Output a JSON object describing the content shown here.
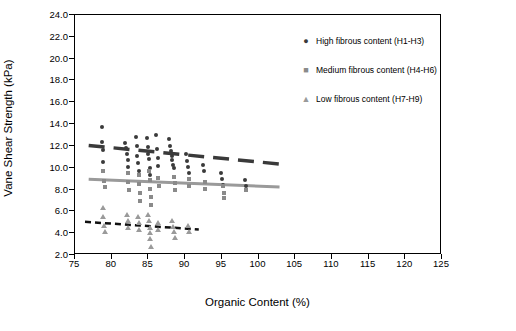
{
  "chart_data": {
    "type": "scatter",
    "title": "",
    "xlabel": "Organic Content (%)",
    "ylabel": "Vane Shear Strength (kPa)",
    "xlim": [
      75,
      125
    ],
    "ylim": [
      2.0,
      24.0
    ],
    "xticks": [
      75,
      80,
      85,
      90,
      95,
      100,
      105,
      110,
      115,
      120,
      125
    ],
    "yticks": [
      "2.0",
      "4.0",
      "6.0",
      "8.0",
      "10.0",
      "12.0",
      "14.0",
      "16.0",
      "18.0",
      "20.0",
      "22.0",
      "24.0"
    ],
    "grid": false,
    "legend_position": "top-right",
    "series": [
      {
        "name": "High fibrous content (H1-H3)",
        "marker": "circle",
        "color": "#3a3a3a",
        "points": [
          [
            78.8,
            13.6
          ],
          [
            78.8,
            12.3
          ],
          [
            78.9,
            11.5
          ],
          [
            79.0,
            10.4
          ],
          [
            82.0,
            12.2
          ],
          [
            82.1,
            11.7
          ],
          [
            82.2,
            11.2
          ],
          [
            82.3,
            10.6
          ],
          [
            82.4,
            10.0
          ],
          [
            83.5,
            12.7
          ],
          [
            83.6,
            11.9
          ],
          [
            83.6,
            11.0
          ],
          [
            83.7,
            10.3
          ],
          [
            83.8,
            9.6
          ],
          [
            85.0,
            12.6
          ],
          [
            85.1,
            11.8
          ],
          [
            85.1,
            11.2
          ],
          [
            85.2,
            10.7
          ],
          [
            85.3,
            9.9
          ],
          [
            85.3,
            9.2
          ],
          [
            86.2,
            12.9
          ],
          [
            86.3,
            11.6
          ],
          [
            86.4,
            10.8
          ],
          [
            86.5,
            10.1
          ],
          [
            88.0,
            12.5
          ],
          [
            88.1,
            11.9
          ],
          [
            88.2,
            11.4
          ],
          [
            88.3,
            11.0
          ],
          [
            88.4,
            10.6
          ],
          [
            88.5,
            10.2
          ],
          [
            88.6,
            9.9
          ],
          [
            90.3,
            11.2
          ],
          [
            90.4,
            10.5
          ],
          [
            90.5,
            10.0
          ],
          [
            90.6,
            9.4
          ],
          [
            92.6,
            10.2
          ],
          [
            92.7,
            9.6
          ],
          [
            95.0,
            9.4
          ],
          [
            95.2,
            8.9
          ],
          [
            95.3,
            8.3
          ],
          [
            98.3,
            8.8
          ],
          [
            98.5,
            8.2
          ]
        ]
      },
      {
        "name": "Medium fibrous content (H4-H6)",
        "marker": "square",
        "color": "#8a8a8a",
        "points": [
          [
            79.0,
            9.6
          ],
          [
            79.1,
            8.7
          ],
          [
            79.2,
            8.1
          ],
          [
            82.3,
            9.4
          ],
          [
            82.4,
            8.6
          ],
          [
            82.5,
            7.9
          ],
          [
            83.8,
            9.2
          ],
          [
            83.9,
            8.4
          ],
          [
            84.0,
            7.6
          ],
          [
            84.0,
            6.9
          ],
          [
            85.2,
            9.6
          ],
          [
            85.3,
            8.8
          ],
          [
            85.4,
            8.0
          ],
          [
            85.5,
            7.2
          ],
          [
            85.5,
            6.5
          ],
          [
            86.5,
            9.0
          ],
          [
            86.6,
            8.2
          ],
          [
            88.6,
            9.1
          ],
          [
            88.7,
            8.5
          ],
          [
            88.8,
            7.9
          ],
          [
            90.6,
            8.9
          ],
          [
            90.7,
            8.2
          ],
          [
            92.8,
            8.6
          ],
          [
            92.9,
            8.0
          ],
          [
            95.3,
            8.2
          ],
          [
            95.4,
            7.6
          ],
          [
            95.5,
            7.1
          ],
          [
            98.5,
            7.9
          ]
        ]
      },
      {
        "name": "Low fibrous content (H7-H9)",
        "marker": "triangle",
        "color": "#9a9a9a",
        "points": [
          [
            78.9,
            6.2
          ],
          [
            79.0,
            5.4
          ],
          [
            79.1,
            4.6
          ],
          [
            79.2,
            4.0
          ],
          [
            82.2,
            5.6
          ],
          [
            82.3,
            5.0
          ],
          [
            82.4,
            4.4
          ],
          [
            83.7,
            5.4
          ],
          [
            83.8,
            4.8
          ],
          [
            83.9,
            4.2
          ],
          [
            85.1,
            5.6
          ],
          [
            85.2,
            5.0
          ],
          [
            85.3,
            4.4
          ],
          [
            85.4,
            3.9
          ],
          [
            85.4,
            3.4
          ],
          [
            85.5,
            2.6
          ],
          [
            86.4,
            4.8
          ],
          [
            86.5,
            4.2
          ],
          [
            88.4,
            5.0
          ],
          [
            88.5,
            4.5
          ],
          [
            88.6,
            4.0
          ],
          [
            88.7,
            3.5
          ],
          [
            90.5,
            4.6
          ],
          [
            90.6,
            4.0
          ]
        ]
      }
    ],
    "trendlines": [
      {
        "name": "High fibrous trend",
        "style": "long-dash",
        "color": "#3a3a3a",
        "width": 3.5,
        "x0": 77.0,
        "y0": 11.95,
        "x1": 103.0,
        "y1": 10.25
      },
      {
        "name": "Medium fibrous trend",
        "style": "solid",
        "color": "#9a9a9a",
        "width": 3.0,
        "x0": 77.0,
        "y0": 8.85,
        "x1": 103.0,
        "y1": 8.15
      },
      {
        "name": "Low fibrous trend",
        "style": "short-dash",
        "color": "#111111",
        "width": 2.5,
        "x0": 76.5,
        "y0": 4.95,
        "x1": 92.0,
        "y1": 4.25
      }
    ]
  },
  "legend": {
    "items": [
      {
        "symbol": "●",
        "color": "#3a3a3a",
        "label": "High fibrous content (H1-H3)"
      },
      {
        "symbol": "■",
        "color": "#8a8a8a",
        "label": "Medium fibrous content (H4-H6)"
      },
      {
        "symbol": "▲",
        "color": "#9a9a9a",
        "label": "Low fibrous content (H7-H9)"
      }
    ]
  }
}
